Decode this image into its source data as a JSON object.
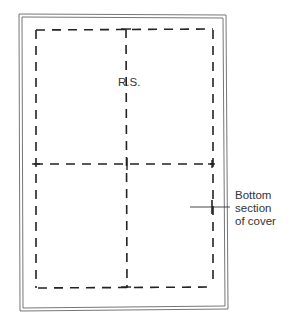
{
  "diagram": {
    "type": "pattern-layout",
    "labels": {
      "rs": "R.S.",
      "bottom_section": [
        "Bottom",
        "section",
        "of cover"
      ]
    },
    "colors": {
      "line": "#222222",
      "border": "#555555",
      "background": "#ffffff"
    }
  }
}
